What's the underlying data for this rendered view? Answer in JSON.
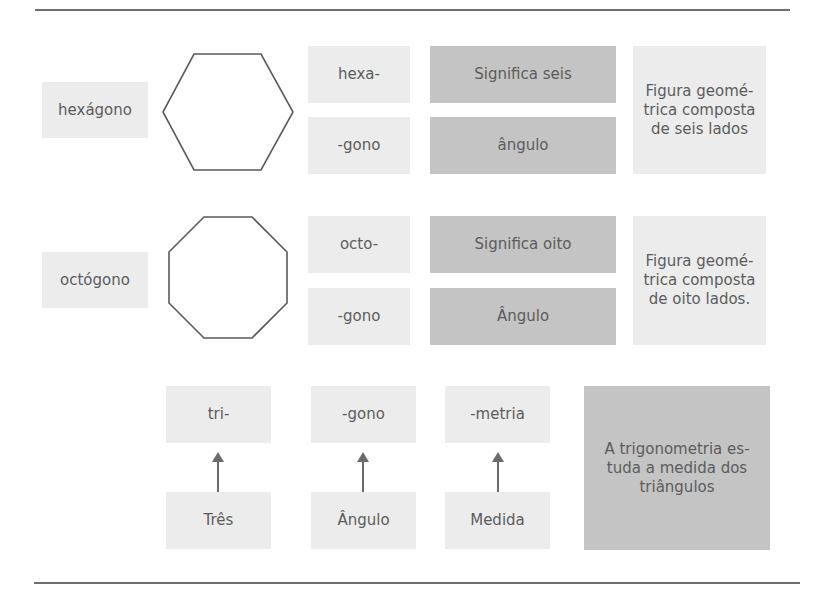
{
  "colors": {
    "light_box": "#ececec",
    "dark_box": "#c4c4c4",
    "text": "#5c5c5c",
    "stroke": "#5a5a5a",
    "rule": "#6e6e6e"
  },
  "rows": [
    {
      "term": "hexágono",
      "shape": "hexagon-icon",
      "parts": [
        {
          "affix": "hexa-",
          "meaning": "Significa seis"
        },
        {
          "affix": "-gono",
          "meaning": "ângulo"
        }
      ],
      "definition": "Figura geomé-trica composta de seis lados"
    },
    {
      "term": "octógono",
      "shape": "octagon-icon",
      "parts": [
        {
          "affix": "octo-",
          "meaning": "Significa oito"
        },
        {
          "affix": "-gono",
          "meaning": "Ângulo"
        }
      ],
      "definition": "Figura geomé-trica composta de oito lados."
    }
  ],
  "trig": {
    "parts": [
      {
        "affix": "tri-",
        "meaning": "Três"
      },
      {
        "affix": "-gono",
        "meaning": "Ângulo"
      },
      {
        "affix": "-metria",
        "meaning": "Medida"
      }
    ],
    "definition": "A trigonometria es-tuda a medida dos triângulos"
  }
}
